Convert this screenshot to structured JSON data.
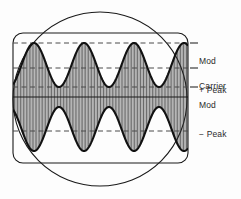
{
  "figure": {
    "background_color": "#fdfdfd",
    "line_color": "#1a1a1a",
    "dashed_color": "#4a4a4a",
    "hatch_color": "#2a2a2a"
  },
  "crt": {
    "bezel_shape": "circle",
    "bezel_center_x": 100,
    "bezel_center_y": 99,
    "bezel_radius": 87,
    "graticule_shape": "rounded-rectangle",
    "graticule_left": 13,
    "graticule_top": 33,
    "graticule_right": 188,
    "graticule_bottom": 163,
    "graticule_corner_radius": 10
  },
  "reference_lines": [
    {
      "name": "mod-plus-peak",
      "y": 43,
      "style": "dashed",
      "label_key": "mod_plus_peak"
    },
    {
      "name": "carrier-upper",
      "y": 68,
      "style": "dashed",
      "label_key": "carrier"
    },
    {
      "name": "mod-minus-peak",
      "y": 87,
      "style": "dashed",
      "label_key": "mod_minus_peak"
    },
    {
      "name": "baseline-center",
      "y": 97,
      "style": "solid",
      "label_key": null
    },
    {
      "name": "mod-lower-mirror",
      "y": 131,
      "style": "dashed",
      "label_key": null
    }
  ],
  "labels": {
    "mod_plus_peak": {
      "line1": "Mod",
      "line2": "+ Peak",
      "tick": "—"
    },
    "carrier": {
      "line1": "Carrier",
      "line2": "",
      "tick": "—"
    },
    "mod_minus_peak": {
      "line1": "Mod",
      "line2": "− Peak",
      "tick": "—"
    }
  },
  "chart_data": {
    "type": "line",
    "xlabel": "",
    "ylabel": "",
    "xlim": [
      0,
      1
    ],
    "ylim": [
      -1.1,
      1.1
    ],
    "grid": false,
    "legend_position": "right",
    "annotations": [
      "Mod + Peak",
      "Carrier",
      "Mod − Peak"
    ],
    "modulation_cycles": 3.5,
    "carrier_fill_lines": 118,
    "envelope": {
      "carrier_amplitude_normalized": 0.62,
      "modulation_depth": 0.6,
      "peak_level_normalized": 1.0,
      "trough_level_normalized": 0.26
    },
    "series": [
      {
        "name": "upper-envelope",
        "description": "positive AM envelope"
      },
      {
        "name": "lower-envelope",
        "description": "negative AM envelope"
      },
      {
        "name": "carrier-fill",
        "description": "dense vertical carrier traces"
      }
    ]
  }
}
